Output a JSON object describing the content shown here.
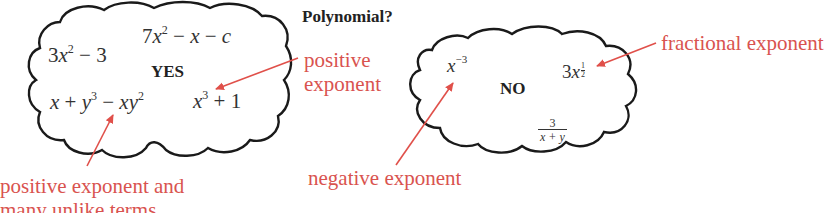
{
  "title": "Polynomial?",
  "colors": {
    "annotation": "#d9534f",
    "arrow": "#e0504a",
    "cloud_outline": "#1a1a1a",
    "math_text": "#333333"
  },
  "yes_cloud": {
    "label": "YES",
    "expressions": [
      {
        "id": "e1",
        "text": "3x² − 3",
        "parts": {
          "coef": "3",
          "var": "x",
          "exp": "2",
          "rest": " − 3"
        }
      },
      {
        "id": "e2",
        "text": "7x² − x − c",
        "parts": {
          "coef": "7",
          "var": "x",
          "exp": "2",
          "rest1": " − ",
          "var2": "x",
          "rest2": " − ",
          "var3": "c"
        }
      },
      {
        "id": "e3",
        "text": "x + y³ − xy²",
        "parts": {
          "a": "x",
          "plus": " + ",
          "b": "y",
          "bexp": "3",
          "minus": " − ",
          "c": "xy",
          "cexp": "2"
        }
      },
      {
        "id": "e4",
        "text": "x³ + 1",
        "parts": {
          "var": "x",
          "exp": "3",
          "rest": " + 1"
        }
      }
    ]
  },
  "no_cloud": {
    "label": "NO",
    "expressions": [
      {
        "id": "n1",
        "text": "x⁻³",
        "parts": {
          "var": "x",
          "exp": "−3"
        }
      },
      {
        "id": "n2",
        "text": "3x^(1/2)",
        "parts": {
          "coef": "3",
          "var": "x",
          "exp_num": "1",
          "exp_den": "2"
        }
      },
      {
        "id": "n3",
        "text": "3/(x + y)",
        "parts": {
          "num": "3",
          "den": "x + y"
        }
      }
    ]
  },
  "annotations": [
    {
      "id": "a1",
      "lines": [
        "positive",
        "exponent"
      ],
      "points_to": "x³ + 1"
    },
    {
      "id": "a2",
      "lines": [
        "positive exponent and",
        "many unlike terms"
      ],
      "points_to": "x + y³ − xy²"
    },
    {
      "id": "a3",
      "lines": [
        "negative exponent"
      ],
      "points_to": "x⁻³"
    },
    {
      "id": "a4",
      "lines": [
        "fractional exponent"
      ],
      "points_to": "3x^(1/2)"
    }
  ]
}
